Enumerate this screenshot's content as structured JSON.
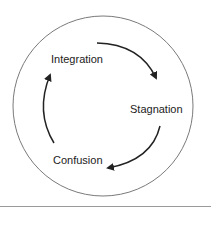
{
  "diagram": {
    "type": "cycle",
    "stages": [
      {
        "label": "Integration"
      },
      {
        "label": "Stagnation"
      },
      {
        "label": "Confusion"
      }
    ],
    "flow": [
      "Integration -> Stagnation",
      "Stagnation -> Confusion",
      "Confusion -> Integration"
    ],
    "colors": {
      "circle": "#7a7a7a",
      "arrow": "#222222",
      "text": "#222222",
      "rule": "#9a9a9a"
    }
  }
}
